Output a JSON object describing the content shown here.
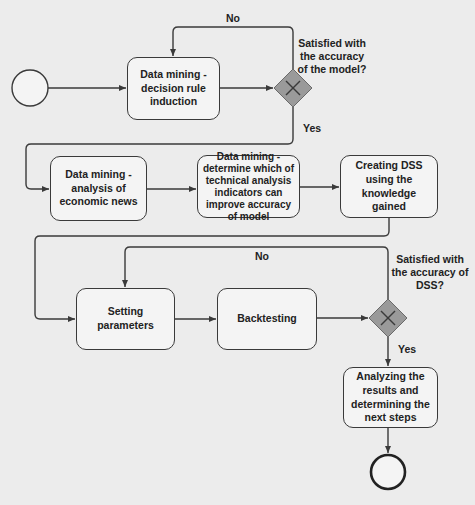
{
  "diagram": {
    "type": "BPMN process flow",
    "colors": {
      "background": "#ececec",
      "stroke": "#3a3a3a",
      "gateway_fill": "#9a9a9a",
      "node_fill": "#f4f4f4"
    },
    "start_event": {
      "icon": "start-circle-icon"
    },
    "end_event": {
      "icon": "end-circle-icon"
    },
    "tasks": [
      {
        "id": "t1",
        "label": "Data mining - decision rule induction"
      },
      {
        "id": "t2",
        "label": "Data mining -analysis of economic news"
      },
      {
        "id": "t3",
        "label": "Data mining - determine which of technical analysis indicators can improve accuracy of model"
      },
      {
        "id": "t4",
        "label": "Creating DSS using the knowledge gained"
      },
      {
        "id": "t5",
        "label": "Setting parameters"
      },
      {
        "id": "t6",
        "label": "Backtesting"
      },
      {
        "id": "t7",
        "label": "Analyzing the results and determining the next steps"
      }
    ],
    "gateways": [
      {
        "id": "g1",
        "question": "Satisfied with the accuracy of the model?",
        "icon": "exclusive-gateway-x-icon",
        "no_label": "No",
        "yes_label": "Yes"
      },
      {
        "id": "g2",
        "question": "Satisfied with the accuracy of DSS?",
        "icon": "exclusive-gateway-x-icon",
        "no_label": "No",
        "yes_label": "Yes"
      }
    ]
  }
}
